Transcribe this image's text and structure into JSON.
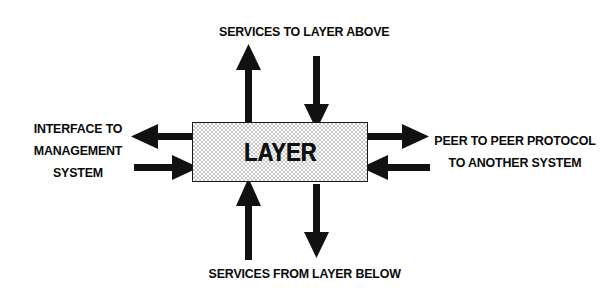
{
  "diagram": {
    "title": "LAYER",
    "center_box": {
      "label": "LAYER",
      "fill": "#fdfdfd",
      "pattern_color": "#c9c9c9",
      "border_color": "#1a1a1a"
    },
    "labels": {
      "top": "SERVICES TO LAYER ABOVE",
      "bottom": "SERVICES FROM LAYER BELOW",
      "left_line1": "INTERFACE TO",
      "left_line2": "MANAGEMENT",
      "left_line3": "SYSTEM",
      "right_line1": "PEER TO PEER PROTOCOL",
      "right_line2": "TO ANOTHER SYSTEM"
    },
    "arrows": [
      {
        "name": "arrow-top-outgoing",
        "direction": "up",
        "side": "top",
        "meaning": "services provided to layer above"
      },
      {
        "name": "arrow-top-incoming",
        "direction": "down",
        "side": "top",
        "meaning": "requests from layer above"
      },
      {
        "name": "arrow-bottom-incoming",
        "direction": "up",
        "side": "bottom",
        "meaning": "services received from layer below"
      },
      {
        "name": "arrow-bottom-outgoing",
        "direction": "down",
        "side": "bottom",
        "meaning": "requests to layer below"
      },
      {
        "name": "arrow-left-outgoing",
        "direction": "left",
        "side": "left",
        "meaning": "to management system"
      },
      {
        "name": "arrow-left-incoming",
        "direction": "right",
        "side": "left",
        "meaning": "from management system"
      },
      {
        "name": "arrow-right-outgoing",
        "direction": "right",
        "side": "right",
        "meaning": "to peer system"
      },
      {
        "name": "arrow-right-incoming",
        "direction": "left",
        "side": "right",
        "meaning": "from peer system"
      }
    ],
    "colors": {
      "ink": "#0a0a0a",
      "background": "#ffffff",
      "arrow": "#111111"
    }
  }
}
